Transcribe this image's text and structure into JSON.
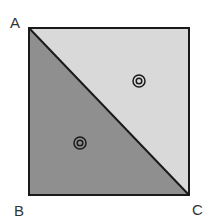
{
  "diagram": {
    "type": "square split by diagonal",
    "labels": {
      "A": "A",
      "B": "B",
      "C": "C"
    },
    "regions": [
      {
        "name": "upper-right triangle",
        "fill": "#d9d9d9",
        "marker": "bullseye"
      },
      {
        "name": "lower-left triangle",
        "fill": "#8f8f8f",
        "marker": "bullseye"
      }
    ],
    "colors": {
      "light": "#d9d9d9",
      "dark": "#8f8f8f",
      "stroke": "#1a1a1a"
    }
  }
}
